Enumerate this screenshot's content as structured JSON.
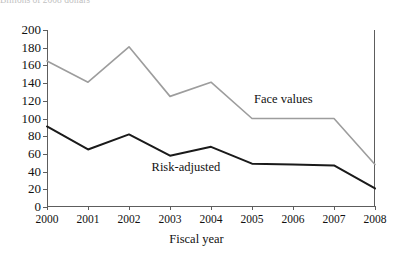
{
  "top_caption": "Billions of 2008 dollars",
  "chart_data": {
    "type": "line",
    "title": "",
    "xlabel": "Fiscal year",
    "ylabel": "",
    "categories": [
      "2000",
      "2001",
      "2002",
      "2003",
      "2004",
      "2005",
      "2006",
      "2007",
      "2008"
    ],
    "x": [
      2000,
      2001,
      2002,
      2003,
      2004,
      2005,
      2006,
      2007,
      2008
    ],
    "xlim": [
      2000,
      2008
    ],
    "ylim": [
      0,
      200
    ],
    "yticks": [
      0,
      20,
      40,
      60,
      80,
      100,
      120,
      140,
      160,
      180,
      200
    ],
    "ytick_labels": [
      "0",
      "20",
      "40",
      "60",
      "80",
      "100",
      "120",
      "140",
      "160",
      "180",
      "200"
    ],
    "grid": false,
    "legend_position": "inline-annotation",
    "series": [
      {
        "name": "Face values",
        "color": "#9d9d9d",
        "width": 1.6,
        "values": [
          165,
          141,
          181,
          125,
          141,
          100,
          100,
          100,
          48
        ],
        "label_x": 2005.05,
        "label_y": 121
      },
      {
        "name": "Risk-adjusted",
        "color": "#1a1a1a",
        "width": 2.0,
        "values": [
          91,
          65,
          82,
          58,
          68,
          49,
          48,
          47,
          21
        ],
        "label_x": 2002.55,
        "label_y": 44
      }
    ]
  }
}
